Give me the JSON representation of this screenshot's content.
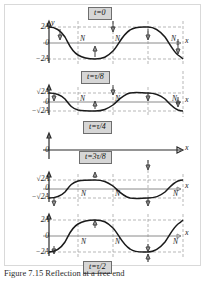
{
  "figure": {
    "x_axis_label": "x",
    "y_axis_label": "y",
    "node_marker": "N",
    "zero_label": "0",
    "colors": {
      "wave": "#1a1a1a",
      "axis": "#8a8a8a",
      "dashed_guide": "#9a9a9a",
      "time_box_fill": "#d6d6d6",
      "time_box_border": "#6e6e6e",
      "figure_border": "#d9d9d9"
    },
    "caption": "Figure  7.15   Reflection at a free end"
  },
  "panels": [
    {
      "id": "panel-t0",
      "time_label": "t=0",
      "amplitude_top": "2A",
      "amplitude_bottom": "−2A",
      "zero": "0",
      "nodes": [
        "N",
        "N",
        "N"
      ],
      "phase_deg": 0,
      "amplitude_value": 2.0,
      "has_axes": true,
      "show_y_axis_label": true
    },
    {
      "id": "panel-t-tau-8",
      "time_label": "t=τ/8",
      "amplitude_top": "√2A",
      "amplitude_bottom": "−√2A",
      "zero": "0",
      "nodes": [
        "N",
        "N",
        "N"
      ],
      "phase_deg": 0,
      "amplitude_value": 1.414,
      "has_axes": true,
      "show_y_axis_label": false
    },
    {
      "id": "panel-t-tau-4",
      "time_label": "t=τ/4",
      "amplitude_top": "",
      "amplitude_bottom": "",
      "zero": "0",
      "nodes": [],
      "phase_deg": 0,
      "amplitude_value": 0.0,
      "has_axes": true,
      "show_y_axis_label": false
    },
    {
      "id": "panel-t-3tau-8",
      "time_label": "t=3τ/8",
      "amplitude_top": "√2A",
      "amplitude_bottom": "−√2A",
      "zero": "0",
      "nodes": [
        "N",
        "N",
        "N"
      ],
      "phase_deg": 180,
      "amplitude_value": 1.414,
      "has_axes": true,
      "show_y_axis_label": false
    },
    {
      "id": "panel-t-tau-2",
      "time_label": "t=τ/2",
      "amplitude_top": "2A",
      "amplitude_bottom": "−2A",
      "zero": "0",
      "nodes": [
        "N",
        "N",
        "N"
      ],
      "phase_deg": 180,
      "amplitude_value": 2.0,
      "has_axes": true,
      "show_y_axis_label": false
    }
  ]
}
